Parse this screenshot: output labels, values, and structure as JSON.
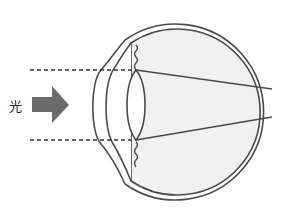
{
  "diagram": {
    "light_label": "光",
    "colors": {
      "stroke": "#4a4a4a",
      "eye_fill": "#f1f1f1",
      "arrow": "#6b6b6b",
      "background": "#ffffff"
    },
    "elements": [
      "cornea",
      "lens",
      "sclera",
      "ciliary-body",
      "light-arrow",
      "light-rays"
    ]
  }
}
